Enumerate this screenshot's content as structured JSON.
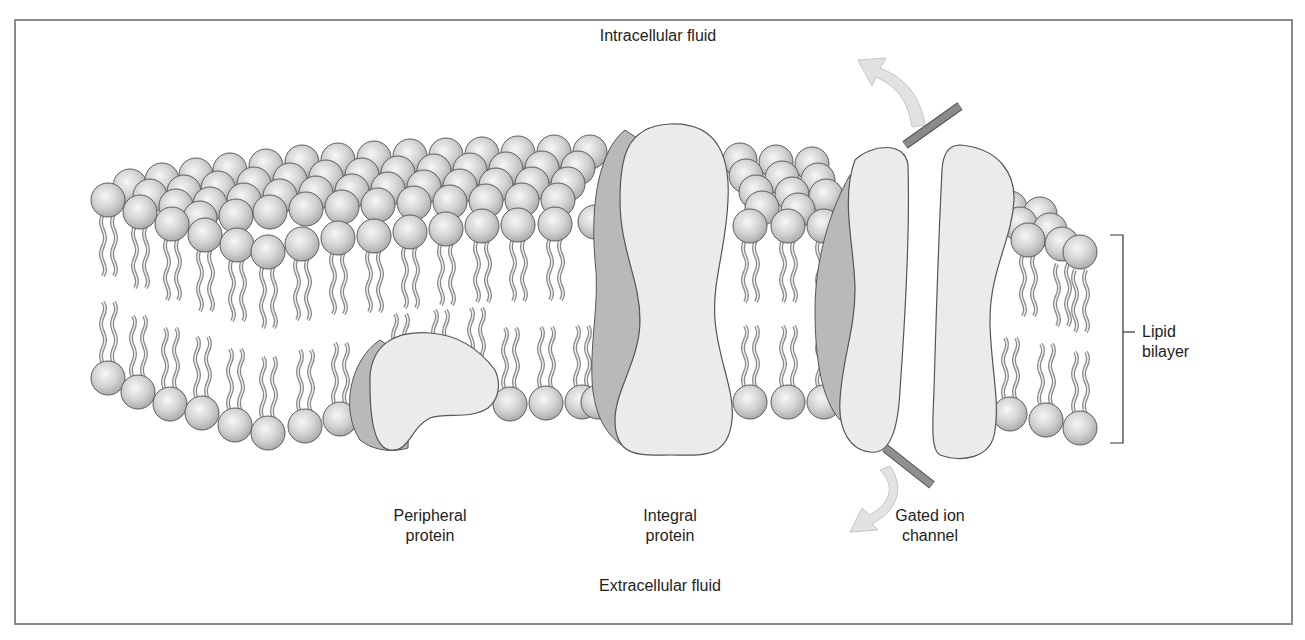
{
  "figure": {
    "labels": {
      "intracellular": "Intracellular fluid",
      "extracellular": "Extracellular fluid",
      "peripheral_protein": "Peripheral\nprotein",
      "integral_protein": "Integral\nprotein",
      "gated_ion_channel": "Gated ion\nchannel",
      "lipid_bilayer": "Lipid\nbilayer"
    },
    "components": [
      {
        "name": "phospholipid-heads",
        "description": "Hydrophilic phosphate heads (spheres)"
      },
      {
        "name": "fatty-acid-tails",
        "description": "Hydrophobic wavy tails"
      },
      {
        "name": "peripheral-protein",
        "description": "Protein attached to inner surface"
      },
      {
        "name": "integral-protein",
        "description": "Protein spanning the bilayer"
      },
      {
        "name": "gated-ion-channel",
        "description": "Two-part channel with gate rods and flow arrows"
      }
    ],
    "colors": {
      "frame": "#8a8a8a",
      "head_fill": "#d6d6d6",
      "head_stroke": "#5c5c5c",
      "tail": "#9a9a9a",
      "protein_fill": "#ebebeb",
      "protein_shadow": "#b9b9b9",
      "gate_rod": "#7c7c7c",
      "arrow_fill": "#e2e2e2",
      "text": "#1e1e1e"
    }
  }
}
